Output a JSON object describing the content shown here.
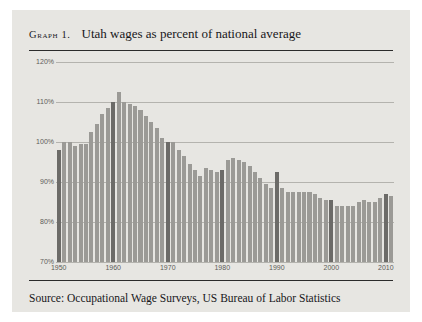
{
  "figure": {
    "graph_label": "Graph 1.",
    "title": "Utah wages as percent of national average",
    "source": "Source: Occupational Wage Surveys, US Bureau of Labor Statistics",
    "background_color": "#e7e6e2",
    "bar_color": "#9b9a96",
    "decade_bar_color": "#6c6b68",
    "gridline_color": "#b4b3ae",
    "rule_color": "#2b2b2b"
  },
  "chart_data": {
    "type": "bar",
    "title": "Utah wages as percent of national average",
    "xlabel": "",
    "ylabel": "",
    "ylim": [
      70,
      120
    ],
    "ytick_labels": [
      "70%",
      "80%",
      "90%",
      "100%",
      "110%",
      "120%"
    ],
    "ytick_values": [
      70,
      80,
      90,
      100,
      110,
      120
    ],
    "xtick_labels": [
      "1950",
      "1960",
      "1970",
      "1980",
      "1990",
      "2000",
      "2010"
    ],
    "xtick_values": [
      1950,
      1960,
      1970,
      1980,
      1990,
      2000,
      2010
    ],
    "grid": true,
    "legend": "none",
    "units": "percent of national average",
    "highlighted_years": [
      1950,
      1960,
      1970,
      1980,
      1990,
      2000,
      2010
    ],
    "categories": [
      1950,
      1951,
      1952,
      1953,
      1954,
      1955,
      1956,
      1957,
      1958,
      1959,
      1960,
      1961,
      1962,
      1963,
      1964,
      1965,
      1966,
      1967,
      1968,
      1969,
      1970,
      1971,
      1972,
      1973,
      1974,
      1975,
      1976,
      1977,
      1978,
      1979,
      1980,
      1981,
      1982,
      1983,
      1984,
      1985,
      1986,
      1987,
      1988,
      1989,
      1990,
      1991,
      1992,
      1993,
      1994,
      1995,
      1996,
      1997,
      1998,
      1999,
      2000,
      2001,
      2002,
      2003,
      2004,
      2005,
      2006,
      2007,
      2008,
      2009,
      2010,
      2011
    ],
    "values": [
      98.0,
      100.0,
      100.0,
      99.0,
      99.5,
      99.5,
      102.5,
      104.5,
      107.0,
      108.5,
      110.0,
      112.5,
      110.0,
      109.5,
      109.0,
      108.0,
      106.5,
      105.0,
      103.5,
      101.0,
      100.0,
      100.0,
      98.0,
      96.5,
      94.5,
      93.0,
      91.5,
      93.5,
      93.0,
      92.5,
      93.0,
      95.5,
      96.0,
      95.5,
      95.0,
      94.0,
      92.5,
      91.0,
      89.5,
      88.5,
      92.5,
      88.5,
      87.5,
      87.5,
      87.5,
      87.5,
      87.5,
      87.0,
      86.0,
      85.5,
      85.5,
      84.0,
      84.0,
      84.0,
      84.0,
      85.0,
      85.5,
      85.0,
      85.0,
      86.0,
      87.0,
      86.5
    ]
  }
}
